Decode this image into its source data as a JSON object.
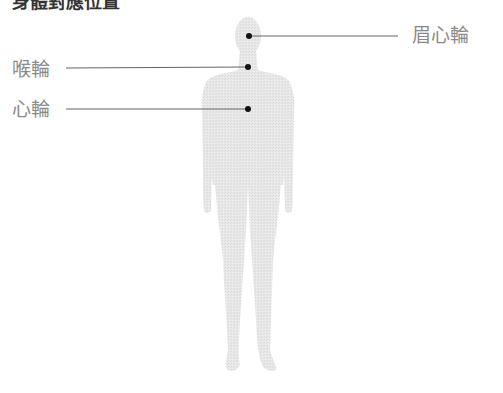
{
  "title": "身體對應位置",
  "figure": {
    "fill_color": "#e6e6e6",
    "dot_color": "#111111",
    "line_color": "#555555"
  },
  "labels": {
    "brow": {
      "text": "眉心輪",
      "side": "right"
    },
    "throat": {
      "text": "喉輪",
      "side": "left"
    },
    "heart": {
      "text": "心輪",
      "side": "left"
    }
  }
}
